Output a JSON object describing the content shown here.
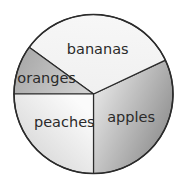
{
  "chart_data": {
    "type": "pie",
    "title": "",
    "start_angle_deg": 270,
    "direction": "counterclockwise",
    "slices": [
      {
        "label": "apples",
        "value": 32,
        "color_from": "#8e8e8e",
        "color_to": "#e2e2e2"
      },
      {
        "label": "bananas",
        "value": 33,
        "color_from": "#f7f7f7",
        "color_to": "#f0f0f0"
      },
      {
        "label": "oranges",
        "value": 10,
        "color_from": "#a9a9a9",
        "color_to": "#d0d0d0"
      },
      {
        "label": "peaches",
        "value": 25,
        "color_from": "#d6d6d6",
        "color_to": "#fbfbfb"
      }
    ],
    "legend": "none",
    "labels_inside": true
  }
}
